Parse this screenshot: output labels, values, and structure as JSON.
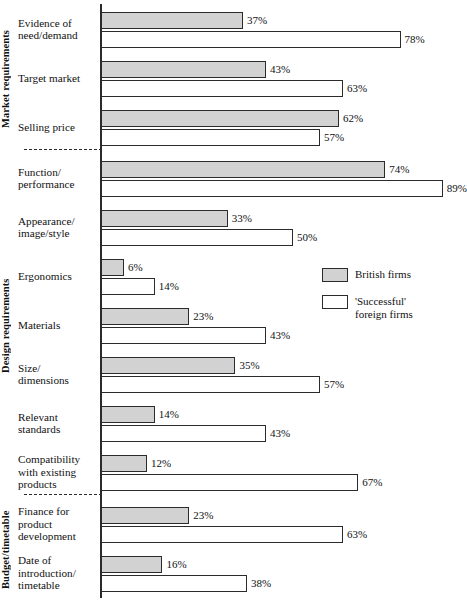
{
  "chart_data": {
    "type": "bar",
    "orientation": "horizontal",
    "title": "",
    "xlabel": "",
    "ylabel": "",
    "xlim": [
      0,
      100
    ],
    "grid": false,
    "legend_position": "middle-right",
    "value_suffix": "%",
    "categories": [
      "Evidence of\nneed/demand",
      "Target market",
      "Selling price",
      "Function/\nperformance",
      "Appearance/\nimage/style",
      "Ergonomics",
      "Materials",
      "Size/\ndimensions",
      "Relevant\nstandards",
      "Compatibility\nwith existing\nproducts",
      "Finance for\nproduct\ndevelopment",
      "Date of\nintroduction/\ntimetable"
    ],
    "series": [
      {
        "name": "British firms",
        "color": "#d2d2d2",
        "values": [
          37,
          43,
          62,
          74,
          33,
          6,
          23,
          35,
          14,
          12,
          23,
          16
        ],
        "labels": [
          "37%",
          "43%",
          "62%",
          "74%",
          "33%",
          "6%",
          "23%",
          "35%",
          "14%",
          "12%",
          "23%",
          "16%"
        ]
      },
      {
        "name": "'Successful' foreign firms",
        "color": "#ffffff",
        "values": [
          78,
          63,
          57,
          89,
          50,
          14,
          43,
          57,
          43,
          67,
          63,
          38
        ],
        "labels": [
          "78%",
          "63%",
          "57%",
          "89%",
          "50%",
          "14%",
          "43%",
          "57%",
          "43%",
          "67%",
          "63%",
          "38%"
        ]
      }
    ],
    "groups": [
      {
        "label": "Market requirements",
        "categories": [
          0,
          1,
          2
        ]
      },
      {
        "label": "Design requirements",
        "categories": [
          3,
          4,
          5,
          6,
          7,
          8,
          9
        ]
      },
      {
        "label": "Budget/timetable",
        "categories": [
          10,
          11
        ]
      }
    ]
  },
  "legend": {
    "items": [
      {
        "label": "British firms",
        "swatch": "british"
      },
      {
        "label": "'Successful'\nforeign firms",
        "swatch": "foreign"
      }
    ]
  }
}
